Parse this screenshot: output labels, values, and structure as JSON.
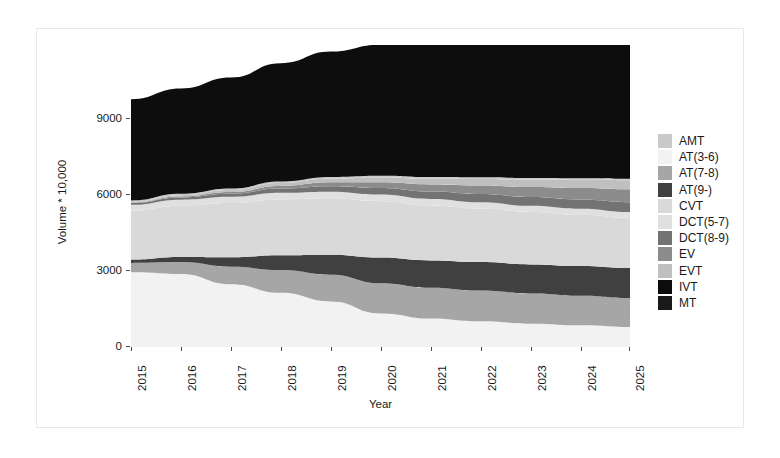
{
  "chart_data": {
    "type": "area",
    "title": "",
    "xlabel": "Year",
    "ylabel": "Volume * 10,000",
    "stacked": true,
    "grid": false,
    "legend_position": "right",
    "x": [
      2015,
      2016,
      2017,
      2018,
      2019,
      2020,
      2021,
      2022,
      2023,
      2024,
      2025
    ],
    "xtick_labels": [
      "2015",
      "2016",
      "2017",
      "2018",
      "2019",
      "2020",
      "2021",
      "2022",
      "2023",
      "2024",
      "2025"
    ],
    "ytick_labels": [
      "0",
      "3000",
      "6000",
      "9000"
    ],
    "ytick_values": [
      0,
      3000,
      6000,
      9000
    ],
    "ylim": [
      0,
      10600
    ],
    "xlim": [
      2015,
      2025
    ],
    "series": [
      {
        "name": "AT(3-6)",
        "color": "#f2f2f2",
        "values": [
          2620,
          2560,
          2200,
          1900,
          1600,
          1180,
          1000,
          900,
          820,
          760,
          700
        ]
      },
      {
        "name": "AT(7-8)",
        "color": "#a6a6a6",
        "values": [
          330,
          420,
          620,
          800,
          940,
          1060,
          1080,
          1080,
          1060,
          1040,
          1020
        ]
      },
      {
        "name": "AT(9-)",
        "color": "#404040",
        "values": [
          120,
          180,
          330,
          520,
          700,
          900,
          960,
          1000,
          1020,
          1040,
          1050
        ]
      },
      {
        "name": "CVT",
        "color": "#d9d9d9",
        "values": [
          1720,
          1800,
          1900,
          1960,
          1980,
          1980,
          1930,
          1880,
          1840,
          1800,
          1760
        ]
      },
      {
        "name": "DCT(5-7)",
        "color": "#e0e0e0",
        "values": [
          200,
          210,
          220,
          230,
          230,
          230,
          225,
          220,
          215,
          210,
          205
        ]
      },
      {
        "name": "DCT(8-9)",
        "color": "#737373",
        "values": [
          60,
          80,
          110,
          150,
          190,
          230,
          260,
          290,
          310,
          330,
          350
        ]
      },
      {
        "name": "EV",
        "color": "#8c8c8c",
        "values": [
          20,
          35,
          60,
          95,
          140,
          200,
          250,
          300,
          350,
          400,
          450
        ]
      },
      {
        "name": "EVT",
        "color": "#bfbfbf",
        "values": [
          30,
          45,
          70,
          100,
          130,
          170,
          200,
          230,
          260,
          290,
          320
        ]
      },
      {
        "name": "AMT",
        "color": "#c9c9c9",
        "values": [
          40,
          45,
          50,
          55,
          58,
          60,
          58,
          56,
          54,
          52,
          50
        ]
      },
      {
        "name": "IVT",
        "color": "#0d0d0d",
        "values": [
          3560,
          3700,
          3900,
          4150,
          4400,
          4600,
          4750,
          4900,
          5000,
          5100,
          5200
        ]
      },
      {
        "name": "MT",
        "color": "#1a1a1a",
        "values": [
          0,
          0,
          0,
          0,
          0,
          0,
          0,
          0,
          0,
          0,
          0
        ]
      }
    ]
  },
  "legend": {
    "items": [
      {
        "label": "AMT",
        "color": "#c9c9c9"
      },
      {
        "label": "AT(3-6)",
        "color": "#f2f2f2"
      },
      {
        "label": "AT(7-8)",
        "color": "#a6a6a6"
      },
      {
        "label": "AT(9-)",
        "color": "#404040"
      },
      {
        "label": "CVT",
        "color": "#d9d9d9"
      },
      {
        "label": "DCT(5-7)",
        "color": "#e0e0e0"
      },
      {
        "label": "DCT(8-9)",
        "color": "#737373"
      },
      {
        "label": "EV",
        "color": "#8c8c8c"
      },
      {
        "label": "EVT",
        "color": "#bfbfbf"
      },
      {
        "label": "IVT",
        "color": "#0d0d0d"
      },
      {
        "label": "MT",
        "color": "#1a1a1a"
      }
    ]
  },
  "axes": {
    "y_title": "Volume * 10,000",
    "x_title": "Year",
    "y_ticks": [
      "9000",
      "6000",
      "3000",
      "0"
    ],
    "x_ticks": [
      "2015",
      "2016",
      "2017",
      "2018",
      "2019",
      "2020",
      "2021",
      "2022",
      "2023",
      "2024",
      "2025"
    ]
  },
  "colors": {
    "panel_background": "#ffffff",
    "frame": "#e8e8e8",
    "text": "#1a1a1a",
    "tick": "#4d4d4d"
  }
}
